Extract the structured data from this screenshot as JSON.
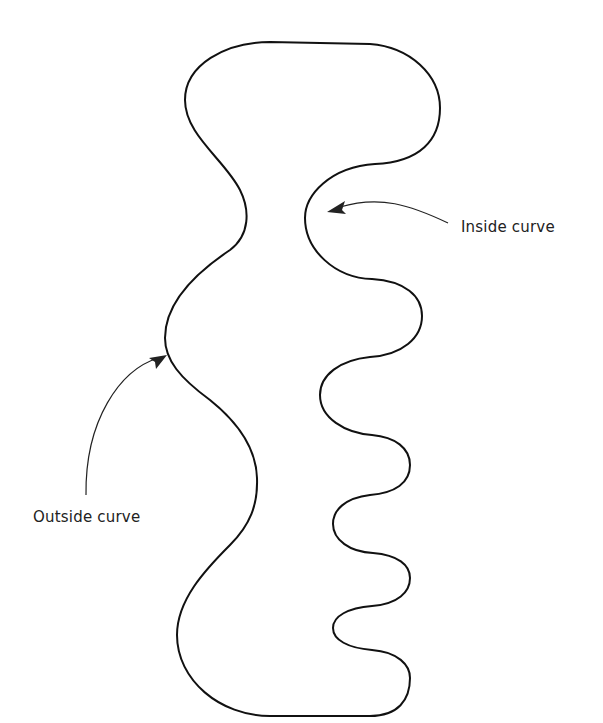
{
  "diagram": {
    "shape": {
      "description": "Irregular closed outline with a wide rounded top, a bulging left side, and a wavy right side with several alternating bumps",
      "stroke_color": "#111111"
    },
    "annotations": [
      {
        "id": "inside",
        "label": "Inside curve",
        "points_to": "concave indentation on the upper right side of the shape"
      },
      {
        "id": "outside",
        "label": "Outside curve",
        "points_to": "convex bulge on the left side of the shape"
      }
    ],
    "arrow_color": "#222222"
  }
}
